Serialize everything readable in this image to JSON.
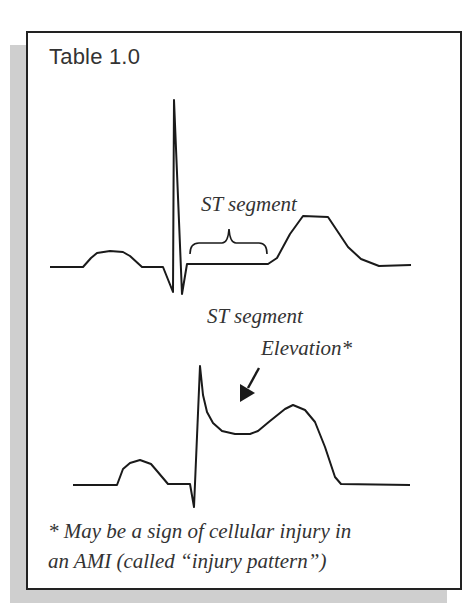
{
  "title": "Table 1.0",
  "normal_ecg": {
    "label": "ST segment",
    "segment_marker": "brace"
  },
  "elevated_ecg": {
    "label_line1": "ST segment",
    "label_line2": "Elevation*",
    "pointer": "arrow"
  },
  "footnote": {
    "line1": "* May be a sign of cellular injury in",
    "line2": "an AMI (called “injury pattern”)"
  },
  "colors": {
    "stroke": "#1a1a1a",
    "text": "#333333",
    "shadow": "#cfcfcf",
    "border": "#222222"
  }
}
